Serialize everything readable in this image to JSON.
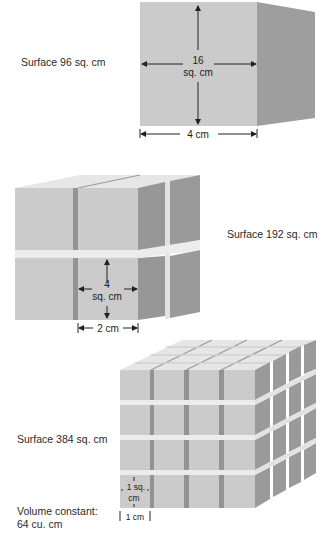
{
  "figure": {
    "colors": {
      "front_face": "#c9c9c9",
      "top_face": "#e4e4e4",
      "side_face": "#9b9b9b",
      "gap_dark": "#8e8e8e",
      "text": "#222222"
    },
    "panels": [
      {
        "name": "single-cube",
        "surface_label": "Surface 96 sq. cm",
        "face_area_value": "16",
        "face_area_unit": "sq. cm",
        "edge_label": "4 cm",
        "grid": "1x1x1"
      },
      {
        "name": "eight-cubes",
        "surface_label": "Surface 192 sq. cm",
        "face_area_value": "4",
        "face_area_unit": "sq. cm",
        "edge_label": "2 cm",
        "grid": "2x2x2"
      },
      {
        "name": "sixty-four-cubes",
        "surface_label": "Surface 384 sq. cm",
        "face_area_value": "1 sq.",
        "face_area_unit": "cm",
        "edge_label": "1 cm",
        "grid": "4x4x4"
      }
    ],
    "volume_note": {
      "line1": "Volume constant:",
      "line2": "64 cu. cm"
    }
  }
}
